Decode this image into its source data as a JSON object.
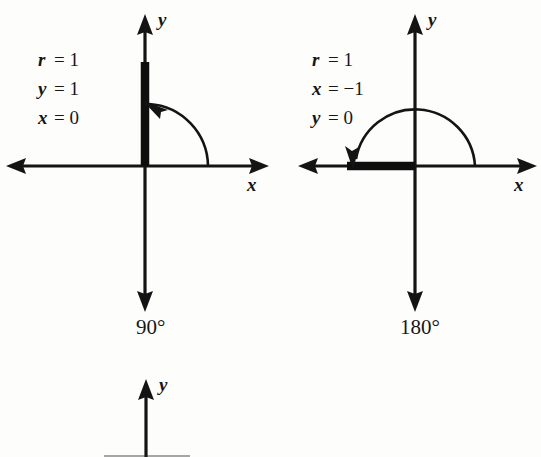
{
  "figure": {
    "background_color": "#fdfdfc",
    "ink_color": "#141414",
    "panels": [
      {
        "id": "panel-90",
        "angle_label": "90°",
        "annotations": [
          {
            "var": "r",
            "eq": "= 1"
          },
          {
            "var": "y",
            "eq": "= 1"
          },
          {
            "var": "x",
            "eq": "= 0"
          }
        ],
        "x_axis_label": "x",
        "y_axis_label": "y",
        "terminal_ray_direction": "positive-y",
        "arc_sweep": "counterclockwise from positive x-axis to positive y-axis",
        "arc_arrow_at": "positive-y-axis"
      },
      {
        "id": "panel-180",
        "angle_label": "180°",
        "annotations": [
          {
            "var": "r",
            "eq": "= 1"
          },
          {
            "var": "x",
            "eq": "= −1"
          },
          {
            "var": "y",
            "eq": "= 0"
          }
        ],
        "x_axis_label": "x",
        "y_axis_label": "y",
        "terminal_ray_direction": "negative-x",
        "arc_sweep": "counterclockwise from positive x-axis to negative x-axis",
        "arc_arrow_at": "negative-x-axis"
      },
      {
        "id": "panel-partial-bottom",
        "angle_label": "",
        "annotations": [],
        "x_axis_label": "",
        "y_axis_label": "y",
        "terminal_ray_direction": "",
        "arc_sweep": "",
        "arc_arrow_at": ""
      }
    ]
  }
}
